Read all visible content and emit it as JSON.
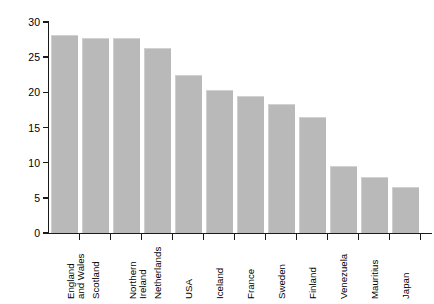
{
  "chart_data": {
    "type": "bar",
    "title": "",
    "xlabel": "",
    "ylabel": "Rate per 1000 women",
    "ylim": [
      0,
      30
    ],
    "yticks": [
      0,
      5,
      10,
      15,
      20,
      25,
      30
    ],
    "grid": false,
    "legend": "none",
    "bar_color": "#b9b9b9",
    "axis_color": "#1a1a1a",
    "background_color": "#ffffff",
    "categories": [
      "England\nand Wales",
      "Scotland",
      "Northern\nIreland",
      "Netherlands",
      "USA",
      "Iceland",
      "France",
      "Sweden",
      "Finland",
      "Venezuela",
      "Mauritius",
      "Japan"
    ],
    "values": [
      28.2,
      27.7,
      27.7,
      26.3,
      22.5,
      20.4,
      19.5,
      18.4,
      16.5,
      9.5,
      8.0,
      6.5
    ]
  }
}
